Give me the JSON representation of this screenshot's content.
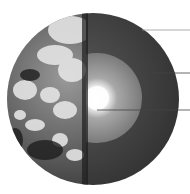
{
  "diagram": {
    "layers": [
      {
        "name": "crust-mantle",
        "color": "#3a3a3a"
      },
      {
        "name": "outer-core",
        "color": "#8a8a8a"
      },
      {
        "name": "inner-core",
        "color": "#ffffff"
      }
    ],
    "leader_lines": [
      {
        "target": "crust"
      },
      {
        "target": "mantle"
      },
      {
        "target": "core"
      }
    ],
    "colors": {
      "background": "#ffffff",
      "ocean": "#2a2a2a",
      "cloud": "#e6e6e6",
      "leader": "#555555"
    }
  }
}
